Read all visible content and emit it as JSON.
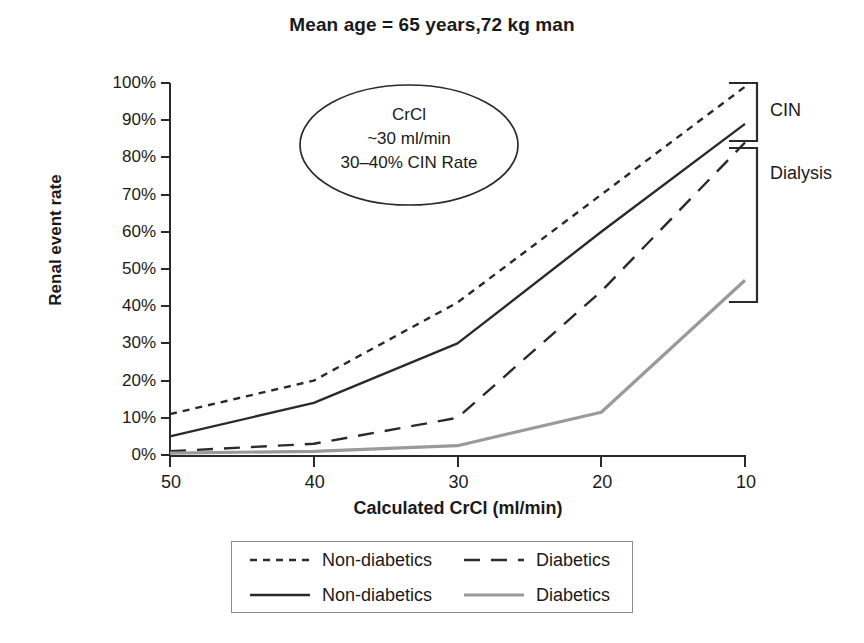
{
  "chart_data": {
    "type": "line",
    "title": "Mean age = 65 years,72 kg man",
    "xlabel": "Calculated CrCl (ml/min)",
    "ylabel": "Renal event rate",
    "x": [
      50,
      40,
      30,
      20,
      10
    ],
    "xtick_labels": [
      "50",
      "40",
      "30",
      "20",
      "10"
    ],
    "xlim": [
      50,
      10
    ],
    "ylim": [
      0,
      100
    ],
    "ytick_labels": [
      "100%",
      "90%",
      "80%",
      "70%",
      "60%",
      "50%",
      "40%",
      "30%",
      "20%",
      "10%",
      "0%"
    ],
    "ytick_values": [
      100,
      90,
      80,
      70,
      60,
      50,
      40,
      30,
      20,
      10,
      0
    ],
    "grid": false,
    "legend_position": "bottom",
    "series": [
      {
        "name": "Non-diabetics",
        "group": "CIN",
        "style": "dotted",
        "color": "#2a2a2a",
        "values": [
          11,
          20,
          41,
          70,
          99
        ]
      },
      {
        "name": "Diabetics",
        "group": "CIN",
        "style": "dashed",
        "color": "#2a2a2a",
        "values": [
          1,
          3,
          10,
          44,
          84
        ]
      },
      {
        "name": "Non-diabetics",
        "group": "Dialysis",
        "style": "solid",
        "color": "#2a2a2a",
        "values": [
          5,
          14,
          30,
          60,
          89
        ]
      },
      {
        "name": "Diabetics",
        "group": "Dialysis",
        "style": "solid-gray",
        "color": "#9a9a9a",
        "values": [
          0.5,
          1,
          2.5,
          11.5,
          47
        ]
      }
    ],
    "annotations": [
      {
        "id": "crcl-callout",
        "shape": "ellipse",
        "line1": "CrCl",
        "line2": "~30 ml/min",
        "line3": "30–40% CIN Rate"
      },
      {
        "id": "bracket-cin",
        "label": "CIN",
        "range": [
          88,
          100
        ]
      },
      {
        "id": "bracket-dialysis",
        "label": "Dialysis",
        "range": [
          46,
          87
        ]
      }
    ]
  },
  "legend": {
    "rows": [
      {
        "entries": [
          {
            "label": "Non-diabetics",
            "style": "dotted",
            "color": "#2a2a2a"
          },
          {
            "label": "Diabetics",
            "style": "dashed",
            "color": "#2a2a2a"
          }
        ]
      },
      {
        "entries": [
          {
            "label": "Non-diabetics",
            "style": "solid",
            "color": "#2a2a2a"
          },
          {
            "label": "Diabetics",
            "style": "solid-gray",
            "color": "#9a9a9a"
          }
        ]
      }
    ]
  },
  "colors": {
    "axis": "#2a2a2a",
    "text": "#1a1a1a",
    "gray_series": "#9a9a9a",
    "background": "#ffffff",
    "legend_border": "#8c8c8c"
  }
}
